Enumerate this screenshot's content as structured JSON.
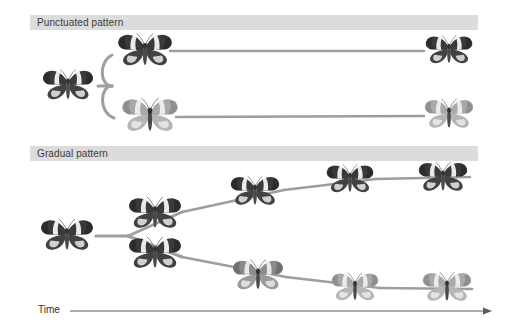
{
  "figure": {
    "type": "diagram",
    "axis_label": "Time",
    "axis_icon": "right-arrow-icon"
  },
  "panels": [
    {
      "id": "punctuated",
      "label": "Punctuated pattern",
      "band": {
        "x": 30,
        "y": 15,
        "width": 448,
        "height": 15
      },
      "description": "Long periods of stasis with an abrupt branching event; no intermediate forms along the horizontal lineages.",
      "branch_style": "abrupt-rounded-fork",
      "nodes": [
        {
          "name": "ancestor",
          "morph": "dark-banded",
          "x": 68,
          "y": 86,
          "size": 56
        },
        {
          "name": "upper-descendant-origin",
          "morph": "dark-banded",
          "x": 145,
          "y": 51,
          "size": 60
        },
        {
          "name": "lower-descendant-origin",
          "morph": "pale-banded",
          "x": 150,
          "y": 116,
          "size": 62
        },
        {
          "name": "upper-descendant-terminal",
          "morph": "dark-banded",
          "x": 449,
          "y": 51,
          "size": 52
        },
        {
          "name": "lower-descendant-terminal",
          "morph": "pale-banded",
          "x": 449,
          "y": 115,
          "size": 54
        }
      ]
    },
    {
      "id": "gradual",
      "label": "Gradual pattern",
      "band": {
        "x": 30,
        "y": 146,
        "width": 448,
        "height": 15
      },
      "description": "Steady incremental change along two diverging lineages, each with a series of intermediate forms.",
      "branch_style": "gradual-v-fork",
      "nodes": [
        {
          "name": "ancestor",
          "morph": "dark-banded",
          "x": 67,
          "y": 236,
          "size": 58
        },
        {
          "name": "upper-step-1",
          "morph": "dark-banded",
          "x": 155,
          "y": 214,
          "size": 58
        },
        {
          "name": "upper-step-2",
          "morph": "dark-banded",
          "x": 255,
          "y": 192,
          "size": 54
        },
        {
          "name": "upper-step-3",
          "morph": "dark-banded",
          "x": 350,
          "y": 180,
          "size": 52
        },
        {
          "name": "upper-terminal",
          "morph": "dark-banded",
          "x": 443,
          "y": 178,
          "size": 54
        },
        {
          "name": "lower-step-1",
          "morph": "dark-banded",
          "x": 155,
          "y": 254,
          "size": 58
        },
        {
          "name": "lower-step-2",
          "morph": "mid-pale",
          "x": 258,
          "y": 276,
          "size": 56
        },
        {
          "name": "lower-step-3",
          "morph": "pale-banded",
          "x": 355,
          "y": 288,
          "size": 52
        },
        {
          "name": "lower-terminal",
          "morph": "pale-banded",
          "x": 447,
          "y": 288,
          "size": 54
        }
      ]
    }
  ],
  "colors": {
    "band_fill": "#dcdcdc",
    "band_text": "#3b3b3b",
    "lineage_line": "#9e9e9e",
    "axis_line": "#5a5a5a",
    "wing_dark": "#3a3a3a",
    "wing_pale": "#ffffff",
    "wing_grey": "#9a9a9a",
    "body_color": "#4a4a4a",
    "background": "#ffffff"
  },
  "time_axis": {
    "label": "Time",
    "x_start": 70,
    "x_end": 492,
    "y": 311
  }
}
